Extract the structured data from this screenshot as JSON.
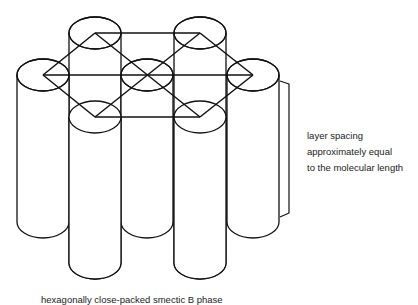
{
  "diagram": {
    "type": "schematic",
    "subject": "hexagonally close-packed smectic B phase",
    "stroke_color": "#111111",
    "background": "#ffffff",
    "cylinders": [
      {
        "id": "back-left",
        "cx": 95,
        "top_cy": 33,
        "bottom_cy": 263
      },
      {
        "id": "back-right",
        "cx": 200,
        "top_cy": 33,
        "bottom_cy": 263
      },
      {
        "id": "mid-left",
        "cx": 43,
        "top_cy": 75,
        "bottom_cy": 222
      },
      {
        "id": "mid-center",
        "cx": 147,
        "top_cy": 75,
        "bottom_cy": 222
      },
      {
        "id": "mid-right",
        "cx": 253,
        "top_cy": 75,
        "bottom_cy": 222
      },
      {
        "id": "front-left",
        "cx": 95,
        "top_cy": 117,
        "bottom_cy": 263
      },
      {
        "id": "front-right",
        "cx": 200,
        "top_cy": 117,
        "bottom_cy": 263
      }
    ],
    "rx": 26,
    "ry": 16,
    "hexagonal_lattice_points": [
      [
        95,
        33
      ],
      [
        200,
        33
      ],
      [
        43,
        75
      ],
      [
        147,
        75
      ],
      [
        253,
        75
      ],
      [
        95,
        117
      ],
      [
        200,
        117
      ]
    ]
  },
  "labels": {
    "side_label_lines": [
      "layer spacing",
      "approximately equal",
      "to the molecular length"
    ],
    "caption": "hexagonally close-packed smectic B phase"
  }
}
